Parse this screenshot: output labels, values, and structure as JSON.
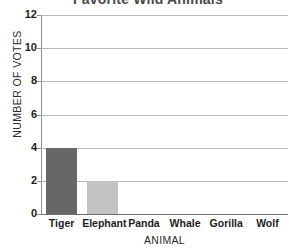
{
  "chart_data": {
    "type": "bar",
    "title": "Favorite Wild Animals",
    "xlabel": "ANIMAL",
    "ylabel": "NUMBER OF VOTES",
    "categories": [
      "Tiger",
      "Elephant",
      "Panda",
      "Whale",
      "Gorilla",
      "Wolf"
    ],
    "values": [
      4,
      2,
      0,
      0,
      0,
      0
    ],
    "ylim": [
      0,
      12
    ],
    "ytick_labels": [
      "12",
      "10",
      "8",
      "6",
      "4",
      "2",
      "0"
    ],
    "yticks": [
      12,
      10,
      8,
      6,
      4,
      2,
      0
    ],
    "ytick_step": 2,
    "grid": true,
    "grid_axis": "y",
    "legend": false,
    "bar_colors": [
      "#676767",
      "#c2c2c2",
      "#676767",
      "#676767",
      "#676767",
      "#676767"
    ],
    "colors": {
      "background": "#ffffff",
      "title": "#4a4a4a",
      "gridline": "#b8b8b8",
      "axis_line": "#8d8d8d",
      "x_axis_line": "#6e6e6e",
      "tick_text": "#1c1c1c",
      "axis_title": "#2b2b2b",
      "bar_tiger": "#676767",
      "bar_elephant": "#c2c2c2"
    }
  }
}
